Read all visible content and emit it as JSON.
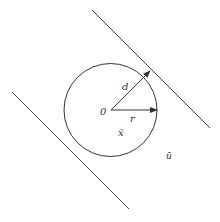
{
  "diagram": {
    "type": "geometry",
    "colors": {
      "stroke": "#333333",
      "background": "#ffffff"
    },
    "circle": {
      "cx": 110.5,
      "cy": 110,
      "r": 46.5
    },
    "lines": [
      {
        "name": "upper-boundary-line",
        "x1": 92,
        "y1": 10,
        "x2": 210,
        "y2": 128
      },
      {
        "name": "lower-boundary-line",
        "x1": 12,
        "y1": 92,
        "x2": 129,
        "y2": 209
      }
    ],
    "arrows": [
      {
        "name": "d-vector",
        "x1": 111,
        "y1": 110,
        "x2": 150,
        "y2": 71
      },
      {
        "name": "r-vector",
        "x1": 111,
        "y1": 110,
        "x2": 157,
        "y2": 110
      }
    ],
    "labels": {
      "origin": "0",
      "d": "d",
      "r": "r",
      "x_bar": "x̄",
      "u_bar": "ū"
    }
  }
}
